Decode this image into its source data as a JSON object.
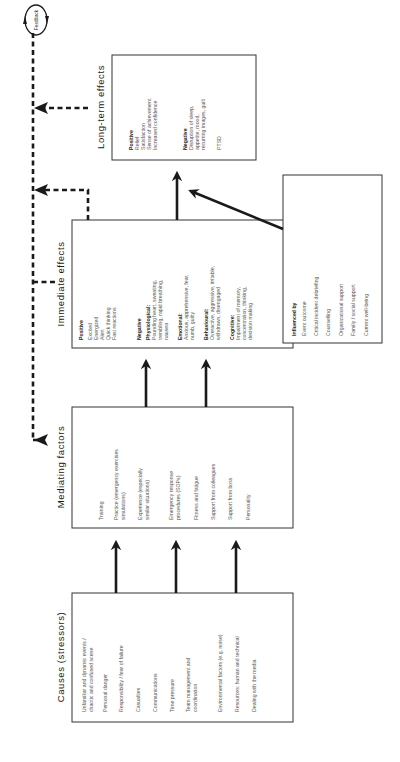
{
  "causes": {
    "title": "Causes (stressors)",
    "items": [
      "Unfamiliar and dynamic events /",
      "chaotic and confused scene",
      "Personal danger",
      "Responsibility / fear of failure",
      "Casualties",
      "Communications",
      "Time pressure",
      "Team management and",
      "coordination",
      "Environmental factors (e.g. noise)",
      "Resources: human and technical",
      "Dealing with the media"
    ]
  },
  "mediating": {
    "title": "Mediating factors",
    "items": [
      "Training",
      "Practice (emergency exercises",
      "simulations)",
      "Experience (especially",
      "similar situations)",
      "Emergency response",
      "procedures (SOPs)",
      "Fitness and fatigue",
      "Support from colleagues",
      "Support from boss",
      "Personality"
    ]
  },
  "immediate": {
    "title": "Immediate effects",
    "positive_heading": "Positive",
    "positive": [
      "Excited",
      "Energized",
      "Alert",
      "Quick thinking",
      "Fast reactions"
    ],
    "negative_heading": "Negative",
    "physiological_heading": "Physiological:",
    "physiological": [
      "Pounding heart, sweating,",
      "trembling, rapid breathing,",
      "nausea"
    ],
    "emotional_heading": "Emotional:",
    "emotional": [
      "Anxious, apprehensive, fear,",
      "numb, guilty"
    ],
    "behavioural_heading": "Behavioural:",
    "behavioural": [
      "Overactive, aggressive, irritable,",
      "withdrawn, disengaged"
    ],
    "cognitive_heading": "Cognitive:",
    "cognitive": [
      "Impairment of memory,",
      "concentration, thinking,",
      "decision making"
    ]
  },
  "longterm": {
    "title": "Long-term effects",
    "positive_heading": "Positive",
    "positive": [
      "Relief",
      "Satisfaction",
      "Sense of achievement",
      "Increased confidence"
    ],
    "negative_heading": "Negative",
    "negative": [
      "Disruption of sleep,",
      "appetite, mood,",
      "recurring images, guilt"
    ],
    "ptsd": "PTSD"
  },
  "influenced": {
    "heading": "Influenced by",
    "items": [
      "Event outcome",
      "Critical incident debriefing",
      "Counselling",
      "Organizational support",
      "Family / social support",
      "Current well-being"
    ]
  },
  "feedback": {
    "label": "Feedback"
  },
  "colors": {
    "line": "#1a1a1a",
    "box_border": "#333333",
    "text": "#555555"
  }
}
